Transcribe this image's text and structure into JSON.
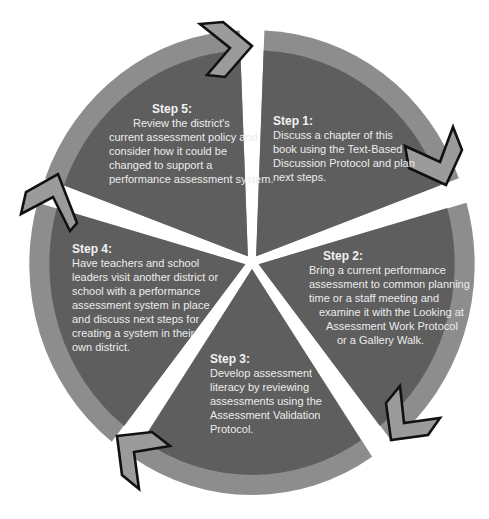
{
  "diagram": {
    "type": "cycle",
    "colors": {
      "segment_fill": "#5e5e5e",
      "ring_fill": "#8d8d8d",
      "arrow_fill": "#9b9b9b",
      "arrow_stroke": "#111111",
      "text": "#ececec",
      "background": "#ffffff"
    },
    "steps": [
      {
        "title": "Step 1:",
        "lines": [
          "Discuss a chapter of this",
          "book using  the Text-Based",
          "Discussion Protocol and plan",
          "next steps."
        ]
      },
      {
        "title": "Step 2:",
        "lines": [
          "Bring a current performance",
          "assessment to common planning",
          "time or a staff meeting and",
          "examine it with the Looking at",
          "Assessment Work Protocol",
          "or a Gallery Walk."
        ]
      },
      {
        "title": "Step 3:",
        "lines": [
          "Develop assessment",
          "literacy by reviewing",
          "assessments using the",
          "Assessment Validation",
          "Protocol."
        ]
      },
      {
        "title": "Step 4:",
        "lines": [
          "Have teachers and school",
          "leaders visit another district or",
          "school with a performance",
          "assessment system in place",
          "and discuss next steps for",
          "creating a system in their",
          "own district."
        ]
      },
      {
        "title": "Step 5:",
        "lines": [
          "Review the district's",
          "current assessment policy and",
          "consider how it could be",
          "changed to support a",
          "performance assessment system."
        ]
      }
    ],
    "arrows": [
      {
        "from": "Step 5",
        "to": "Step 1",
        "icon": "chevron-arrow-icon"
      },
      {
        "from": "Step 1",
        "to": "Step 2",
        "icon": "chevron-arrow-icon"
      },
      {
        "from": "Step 2",
        "to": "Step 3",
        "icon": "chevron-arrow-icon"
      },
      {
        "from": "Step 3",
        "to": "Step 4",
        "icon": "chevron-arrow-icon"
      },
      {
        "from": "Step 4",
        "to": "Step 5",
        "icon": "chevron-arrow-icon"
      }
    ]
  }
}
